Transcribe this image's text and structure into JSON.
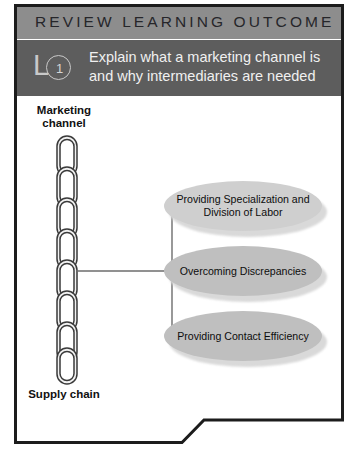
{
  "banner": {
    "title": "REVIEW LEARNING OUTCOME",
    "lo_letter": "L",
    "lo_number": "1",
    "objective": "Explain what a marketing channel is and why intermediaries are needed"
  },
  "diagram": {
    "top_label": "Marketing channel",
    "bottom_label": "Supply chain",
    "chain_icon": "chain-links-icon",
    "outcomes": [
      {
        "label": "Providing Specialization and Division of Labor",
        "fill": "#cfcfcf"
      },
      {
        "label": "Overcoming Discrepancies",
        "fill": "#bfbfbf"
      },
      {
        "label": "Providing Contact Efficiency",
        "fill": "#bfbfbf"
      }
    ]
  },
  "colors": {
    "banner_title_bg": "#8d8d8d",
    "banner_objective_bg": "#5d5d5d",
    "frame_border": "#1c1c1c",
    "ellipse_fill": "#bfbfbf",
    "ellipse_fill_light": "#cfcfcf",
    "connector_line": "#6d6d6d"
  }
}
